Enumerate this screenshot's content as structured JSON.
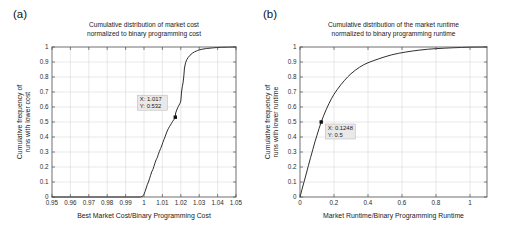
{
  "figure": {
    "panels": [
      {
        "letter": "(a)",
        "title_line1": "Cumulative distribution of market cost",
        "title_line2": "normalized to binary programming cost",
        "datacursor": {
          "x_label": "X: 1.017",
          "y_label": "Y: 0.532",
          "x": 1.017,
          "y": 0.532
        }
      },
      {
        "letter": "(b)",
        "title_line1": "Cumulative distribution of the market runtime",
        "title_line2": "normalized to binary programming runtime",
        "datacursor": {
          "x_label": "X: 0.1248",
          "y_label": "Y: 0.5",
          "x": 0.1248,
          "y": 0.5
        }
      }
    ]
  },
  "chart_data": [
    {
      "type": "line",
      "title": "Cumulative distribution of market cost normalized to binary programming cost",
      "xlabel": "Best Market Cost/Binary Programming Cost",
      "ylabel": "Cumulative frequency of runs with lower cost",
      "xlim": [
        0.95,
        1.05
      ],
      "ylim": [
        0,
        1
      ],
      "grid": true,
      "legend": "none",
      "xticks": [
        0.95,
        0.96,
        0.97,
        0.98,
        0.99,
        1,
        1.01,
        1.02,
        1.03,
        1.04,
        1.05
      ],
      "xticklabels": [
        "0.95",
        "0.96",
        "0.97",
        "0.98",
        "0.99",
        "1",
        "1.01",
        "1.02",
        "1.03",
        "1.04",
        "1.05"
      ],
      "yticks": [
        0,
        0.1,
        0.2,
        0.3,
        0.4,
        0.5,
        0.6,
        0.7,
        0.8,
        0.9,
        1
      ],
      "yticklabels": [
        "0",
        "0.1",
        "0.2",
        "0.3",
        "0.4",
        "0.5",
        "0.6",
        "0.7",
        "0.8",
        "0.9",
        "1"
      ],
      "x": [
        0.95,
        0.998,
        0.999,
        0.9996,
        1.0,
        1.0006,
        1.0012,
        1.0018,
        1.0024,
        1.003,
        1.0036,
        1.0042,
        1.0048,
        1.0054,
        1.006,
        1.0066,
        1.0072,
        1.0078,
        1.0084,
        1.009,
        1.0096,
        1.0102,
        1.0108,
        1.0114,
        1.012,
        1.0126,
        1.0132,
        1.0138,
        1.0144,
        1.015,
        1.0156,
        1.0162,
        1.0168,
        1.017,
        1.0172,
        1.0178,
        1.0184,
        1.019,
        1.0196,
        1.02,
        1.0204,
        1.0208,
        1.0212,
        1.0216,
        1.022,
        1.0226,
        1.0232,
        1.024,
        1.025,
        1.0262,
        1.0275,
        1.029,
        1.031,
        1.034,
        1.038,
        1.042,
        1.046,
        1.05
      ],
      "y": [
        0.0,
        0.0,
        0.004,
        0.01,
        0.018,
        0.038,
        0.06,
        0.082,
        0.1,
        0.122,
        0.145,
        0.168,
        0.182,
        0.205,
        0.228,
        0.248,
        0.262,
        0.285,
        0.305,
        0.322,
        0.34,
        0.362,
        0.382,
        0.4,
        0.42,
        0.44,
        0.455,
        0.468,
        0.48,
        0.492,
        0.505,
        0.515,
        0.528,
        0.532,
        0.56,
        0.58,
        0.598,
        0.612,
        0.625,
        0.64,
        0.7,
        0.735,
        0.76,
        0.8,
        0.86,
        0.895,
        0.915,
        0.93,
        0.945,
        0.958,
        0.968,
        0.976,
        0.984,
        0.99,
        0.995,
        0.998,
        0.999,
        1.0
      ]
    },
    {
      "type": "line",
      "title": "Cumulative distribution of the market runtime normalized to binary programming runtime",
      "xlabel": "Market Runtime/Binary Programming Runtime",
      "ylabel": "Cumulative frequency of runs with lower runtime",
      "xlim": [
        0,
        1.1
      ],
      "ylim": [
        0,
        1
      ],
      "grid": true,
      "legend": "none",
      "xticks": [
        0,
        0.2,
        0.4,
        0.6,
        0.8,
        1
      ],
      "xticklabels": [
        "0",
        "0.2",
        "0.4",
        "0.6",
        "0.8",
        "1"
      ],
      "yticks": [
        0,
        0.1,
        0.2,
        0.3,
        0.4,
        0.5,
        0.6,
        0.7,
        0.8,
        0.9,
        1
      ],
      "yticklabels": [
        "0",
        "0.1",
        "0.2",
        "0.3",
        "0.4",
        "0.5",
        "0.6",
        "0.7",
        "0.8",
        "0.9",
        "1"
      ],
      "x": [
        0.0,
        0.012,
        0.025,
        0.038,
        0.05,
        0.062,
        0.075,
        0.088,
        0.1,
        0.1124,
        0.1248,
        0.14,
        0.155,
        0.17,
        0.185,
        0.2,
        0.22,
        0.24,
        0.26,
        0.28,
        0.3,
        0.325,
        0.35,
        0.375,
        0.4,
        0.43,
        0.46,
        0.5,
        0.54,
        0.58,
        0.62,
        0.66,
        0.7,
        0.75,
        0.8,
        0.85,
        0.9,
        0.95,
        1.0,
        1.1
      ],
      "y": [
        0.0,
        0.052,
        0.106,
        0.16,
        0.212,
        0.262,
        0.315,
        0.368,
        0.412,
        0.458,
        0.5,
        0.545,
        0.585,
        0.622,
        0.655,
        0.685,
        0.718,
        0.748,
        0.775,
        0.8,
        0.822,
        0.845,
        0.865,
        0.882,
        0.895,
        0.908,
        0.92,
        0.935,
        0.948,
        0.958,
        0.966,
        0.973,
        0.979,
        0.985,
        0.989,
        0.992,
        0.995,
        0.997,
        0.999,
        1.0
      ]
    }
  ]
}
